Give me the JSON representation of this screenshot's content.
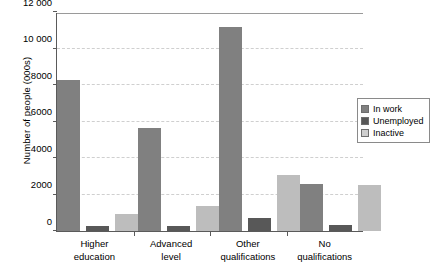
{
  "chart_data": {
    "type": "bar",
    "title": "",
    "xlabel": "",
    "ylabel": "Number of people (000s)",
    "ylim": [
      0,
      12000
    ],
    "yticks": [
      0,
      2000,
      4000,
      6000,
      8000,
      10000,
      12000
    ],
    "ytick_labels": [
      "0",
      "2000",
      "4000",
      "6000",
      "8000",
      "10 000",
      "12 000"
    ],
    "grid": true,
    "legend_position": "right",
    "categories": [
      "Higher education",
      "Advanced level",
      "Other qualifications",
      "No qualifications"
    ],
    "category_lines": [
      [
        "Higher",
        "education"
      ],
      [
        "Advanced",
        "level"
      ],
      [
        "Other",
        "qualifications"
      ],
      [
        "No",
        "qualifications"
      ]
    ],
    "series": [
      {
        "name": "In work",
        "color": "#808080",
        "values": [
          8250,
          5650,
          11200,
          2550
        ]
      },
      {
        "name": "Unemployed",
        "color": "#585858",
        "values": [
          250,
          280,
          700,
          330
        ]
      },
      {
        "name": "Inactive",
        "color": "#bdbdbd",
        "values": [
          950,
          1350,
          3050,
          2530
        ]
      }
    ]
  },
  "legend": {
    "items": [
      {
        "label": "In work"
      },
      {
        "label": "Unemployed"
      },
      {
        "label": "Inactive"
      }
    ]
  }
}
